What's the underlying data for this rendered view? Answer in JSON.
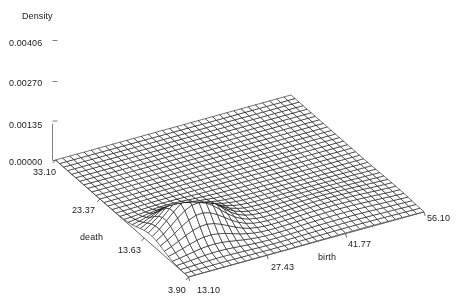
{
  "figure": {
    "background_color": "#ffffff",
    "line_color": "#000000",
    "axis_color": "#808080",
    "width": 466,
    "height": 304
  },
  "axes": {
    "z": {
      "title": "Density",
      "ticks": [
        "0.00406",
        "0.00270",
        "0.00135",
        "0.00000"
      ],
      "values": [
        0.00406,
        0.0027,
        0.00135,
        0.0
      ]
    },
    "x": {
      "title": "death",
      "ticks": [
        "33.10",
        "23.37",
        "13.63",
        "3.90"
      ],
      "values": [
        33.1,
        23.37,
        13.63,
        3.9
      ]
    },
    "y": {
      "title": "birth",
      "ticks": [
        "13.10",
        "27.43",
        "41.77",
        "56.10"
      ],
      "values": [
        13.1,
        27.43,
        41.77,
        56.1
      ]
    }
  },
  "chart_data": {
    "type": "surface",
    "title": "",
    "xlabel": "death",
    "ylabel": "birth",
    "zlabel": "Density",
    "xlim": [
      3.9,
      33.1
    ],
    "ylim": [
      13.1,
      56.1
    ],
    "zlim": [
      0.0,
      0.00406
    ],
    "grid": false,
    "legend": null,
    "mesh": {
      "nx": 34,
      "ny": 34,
      "wireframe": true,
      "hidden_line_removal": true
    },
    "projection": {
      "azimuth_deg": -52,
      "elevation_deg": 26
    },
    "components": [
      {
        "name": "primary-mode",
        "death": 12.2,
        "birth": 20.5,
        "peak_density": 0.00406,
        "sigma_death": 2.6,
        "sigma_birth": 4.3,
        "weight": 1.0
      },
      {
        "name": "secondary-mode",
        "death": 9.6,
        "birth": 44.0,
        "peak_density": 0.00125,
        "sigma_death": 3.2,
        "sigma_birth": 7.5,
        "weight": 0.31
      },
      {
        "name": "shoulder-mode",
        "death": 16.5,
        "birth": 28.0,
        "peak_density": 0.0007,
        "sigma_death": 5.0,
        "sigma_birth": 8.0,
        "weight": 0.17
      }
    ]
  },
  "labels": {
    "z_title": {
      "text": "Density",
      "x": 22,
      "y": 11
    },
    "z_ticks": [
      {
        "text": "0.00406",
        "x": 9,
        "y": 38
      },
      {
        "text": "0.00270",
        "x": 9,
        "y": 78
      },
      {
        "text": "0.00135",
        "x": 9,
        "y": 120
      },
      {
        "text": "0.00000",
        "x": 9,
        "y": 157
      }
    ],
    "x_ticks": [
      {
        "text": "33.10",
        "x": 33,
        "y": 167
      },
      {
        "text": "23.37",
        "x": 72,
        "y": 205
      },
      {
        "text": "13.63",
        "x": 118,
        "y": 245
      },
      {
        "text": "3.90",
        "x": 168,
        "y": 285
      }
    ],
    "y_ticks": [
      {
        "text": "13.10",
        "x": 197,
        "y": 285
      },
      {
        "text": "27.43",
        "x": 271,
        "y": 262
      },
      {
        "text": "41.77",
        "x": 348,
        "y": 239
      },
      {
        "text": "56.10",
        "x": 427,
        "y": 213
      }
    ],
    "x_title": {
      "text": "death",
      "x": 80,
      "y": 232
    },
    "y_title": {
      "text": "birth",
      "x": 318,
      "y": 252
    }
  }
}
